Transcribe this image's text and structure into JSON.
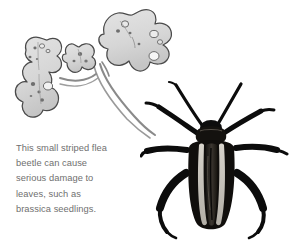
{
  "page": {
    "background_color": "#ffffff",
    "width": 289,
    "height": 246
  },
  "caption": {
    "text_color": "#6f6f6f",
    "full_text": "This small striped flea beetle can cause serious damage to leaves, such as brassica seedlings.",
    "lines": [
      "This small striped flea",
      "beetle can cause",
      "serious damage to",
      "leaves, such as",
      "brassica seedlings."
    ]
  },
  "leaf_illustration": {
    "name": "damaged-brassica-leaves",
    "description": "Pencil line drawing of three lobed brassica leaves on curving stems, peppered with small holes from flea beetle feeding damage",
    "fill_color": "#d9d9d9",
    "outline_color": "#4a4a4a",
    "hole_color": "#6a6a6a",
    "stem_color": "#7a7a7a",
    "leaf_count": 3,
    "holes_visible": true
  },
  "beetle_photo": {
    "name": "striped-flea-beetle",
    "description": "Black and white photograph of a striped flea beetle viewed from above, with two pale longitudinal stripes on the elytra, six legs and two long antennae",
    "body_color": "#111111",
    "stripe_color": "#c9c6c0",
    "elytra_center_color": "#2e2b28",
    "stripe_count": 2,
    "leg_count": 6,
    "antenna_count": 2
  }
}
